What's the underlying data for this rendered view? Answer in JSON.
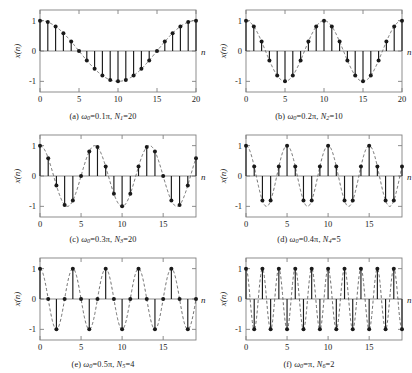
{
  "figure": {
    "ylabel": "x(n)",
    "xlabel": "n",
    "yticks": [
      "1",
      "0",
      "-1"
    ],
    "ylim": [
      -1.35,
      1.35
    ],
    "colors": {
      "stem": "#1a1a1a",
      "marker": "#1a1a1a",
      "envelope": "#555555",
      "axis": "#808080",
      "text": "#1a1a1a"
    }
  },
  "chart_data": [
    {
      "type": "line",
      "panel": "a",
      "title": "(a) ω0=0.1π, N1=20",
      "caption_prefix": "(a) ",
      "omega_label": "ω",
      "omega_sub": "0",
      "omega_value": "=0.1π, ",
      "N_label": "N",
      "N_sub": "1",
      "N_value": "=20",
      "xlabel": "n",
      "ylabel": "x(n)",
      "xlim": [
        0,
        20
      ],
      "ylim": [
        -1.35,
        1.35
      ],
      "xticks": [
        0,
        5,
        10,
        15,
        20
      ],
      "xticklabels": [
        "0",
        "5",
        "10",
        "15",
        "20"
      ],
      "yticks": [
        1,
        0,
        -1
      ],
      "yticklabels": [
        "1",
        "0",
        "-1"
      ],
      "omega": 0.1,
      "period": 20,
      "x": [
        0,
        1,
        2,
        3,
        4,
        5,
        6,
        7,
        8,
        9,
        10,
        11,
        12,
        13,
        14,
        15,
        16,
        17,
        18,
        19,
        20
      ],
      "values": [
        1.0,
        0.951,
        0.809,
        0.588,
        0.309,
        0.0,
        -0.309,
        -0.588,
        -0.809,
        -0.951,
        -1.0,
        -0.951,
        -0.809,
        -0.588,
        -0.309,
        0.0,
        0.309,
        0.588,
        0.809,
        0.951,
        1.0
      ],
      "grid": false,
      "legend": "none"
    },
    {
      "type": "line",
      "panel": "b",
      "title": "(b) ω0=0.2π, N2=10",
      "caption_prefix": "(b) ",
      "omega_label": "ω",
      "omega_sub": "0",
      "omega_value": "=0.2π, ",
      "N_label": "N",
      "N_sub": "2",
      "N_value": "=10",
      "xlabel": "n",
      "ylabel": "x(n)",
      "xlim": [
        0,
        20
      ],
      "ylim": [
        -1.35,
        1.35
      ],
      "xticks": [
        0,
        5,
        10,
        15,
        20
      ],
      "xticklabels": [
        "0",
        "5",
        "10",
        "15",
        "20"
      ],
      "yticks": [
        1,
        0,
        -1
      ],
      "yticklabels": [
        "1",
        "0",
        "-1"
      ],
      "omega": 0.2,
      "period": 10,
      "x": [
        0,
        1,
        2,
        3,
        4,
        5,
        6,
        7,
        8,
        9,
        10,
        11,
        12,
        13,
        14,
        15,
        16,
        17,
        18,
        19,
        20
      ],
      "values": [
        1.0,
        0.809,
        0.309,
        -0.309,
        -0.809,
        -1.0,
        -0.809,
        -0.309,
        0.309,
        0.809,
        1.0,
        0.809,
        0.309,
        -0.309,
        -0.809,
        -1.0,
        -0.809,
        -0.309,
        0.309,
        0.809,
        1.0
      ],
      "grid": false,
      "legend": "none"
    },
    {
      "type": "line",
      "panel": "c",
      "title": "(c) ω0=0.3π, N3=20",
      "caption_prefix": "(c) ",
      "omega_label": "ω",
      "omega_sub": "0",
      "omega_value": "=0.3π, ",
      "N_label": "N",
      "N_sub": "3",
      "N_value": "=20",
      "xlabel": "n",
      "ylabel": "x(n)",
      "xlim": [
        0,
        19
      ],
      "ylim": [
        -1.35,
        1.35
      ],
      "xticks": [
        0,
        5,
        10,
        15
      ],
      "xticklabels": [
        "0",
        "5",
        "10",
        "15"
      ],
      "yticks": [
        1,
        0,
        -1
      ],
      "yticklabels": [
        "1",
        "0",
        "-1"
      ],
      "omega": 0.3,
      "period": 20,
      "x": [
        0,
        1,
        2,
        3,
        4,
        5,
        6,
        7,
        8,
        9,
        10,
        11,
        12,
        13,
        14,
        15,
        16,
        17,
        18,
        19
      ],
      "values": [
        1.0,
        0.588,
        -0.309,
        -0.951,
        -0.809,
        0.0,
        0.809,
        0.951,
        0.309,
        -0.588,
        -1.0,
        -0.588,
        0.309,
        0.951,
        0.809,
        0.0,
        -0.809,
        -0.951,
        -0.309,
        0.588
      ],
      "grid": false,
      "legend": "none"
    },
    {
      "type": "line",
      "panel": "d",
      "title": "(d) ω0=0.4π, N4=5",
      "caption_prefix": "(d) ",
      "omega_label": "ω",
      "omega_sub": "0",
      "omega_value": "=0.4π, ",
      "N_label": "N",
      "N_sub": "4",
      "N_value": "=5",
      "xlabel": "n",
      "ylabel": "x(n)",
      "xlim": [
        0,
        19
      ],
      "ylim": [
        -1.35,
        1.35
      ],
      "xticks": [
        0,
        5,
        10,
        15
      ],
      "xticklabels": [
        "0",
        "5",
        "10",
        "15"
      ],
      "yticks": [
        1,
        0,
        -1
      ],
      "yticklabels": [
        "1",
        "0",
        "-1"
      ],
      "omega": 0.4,
      "period": 5,
      "x": [
        0,
        1,
        2,
        3,
        4,
        5,
        6,
        7,
        8,
        9,
        10,
        11,
        12,
        13,
        14,
        15,
        16,
        17,
        18,
        19
      ],
      "values": [
        1.0,
        0.309,
        -0.809,
        -0.809,
        0.309,
        1.0,
        0.309,
        -0.809,
        -0.809,
        0.309,
        1.0,
        0.309,
        -0.809,
        -0.809,
        0.309,
        1.0,
        0.309,
        -0.809,
        -0.809,
        0.309
      ],
      "grid": false,
      "legend": "none"
    },
    {
      "type": "line",
      "panel": "e",
      "title": "(e) ω0=0.5π, N5=4",
      "caption_prefix": "(e) ",
      "omega_label": "ω",
      "omega_sub": "0",
      "omega_value": "=0.5π, ",
      "N_label": "N",
      "N_sub": "5",
      "N_value": "=4",
      "xlabel": "n",
      "ylabel": "x(n)",
      "xlim": [
        0,
        19
      ],
      "ylim": [
        -1.35,
        1.35
      ],
      "xticks": [
        0,
        5,
        10,
        15
      ],
      "xticklabels": [
        "0",
        "5",
        "10",
        "15"
      ],
      "yticks": [
        1,
        0,
        -1
      ],
      "yticklabels": [
        "1",
        "0",
        "-1"
      ],
      "omega": 0.5,
      "period": 4,
      "x": [
        0,
        1,
        2,
        3,
        4,
        5,
        6,
        7,
        8,
        9,
        10,
        11,
        12,
        13,
        14,
        15,
        16,
        17,
        18,
        19
      ],
      "values": [
        1.0,
        0.0,
        -1.0,
        0.0,
        1.0,
        0.0,
        -1.0,
        0.0,
        1.0,
        0.0,
        -1.0,
        0.0,
        1.0,
        0.0,
        -1.0,
        0.0,
        1.0,
        0.0,
        -1.0,
        0.0
      ],
      "grid": false,
      "legend": "none"
    },
    {
      "type": "line",
      "panel": "f",
      "title": "(f) ω0=π, N6=2",
      "caption_prefix": "(f) ",
      "omega_label": "ω",
      "omega_sub": "0",
      "omega_value": "=π, ",
      "N_label": "N",
      "N_sub": "6",
      "N_value": "=2",
      "xlabel": "n",
      "ylabel": "x(n)",
      "xlim": [
        0,
        19
      ],
      "ylim": [
        -1.35,
        1.35
      ],
      "xticks": [
        0,
        5,
        10,
        15
      ],
      "xticklabels": [
        "0",
        "5",
        "10",
        "15"
      ],
      "yticks": [
        1,
        0,
        -1
      ],
      "yticklabels": [
        "1",
        "0",
        "-1"
      ],
      "omega": 1.0,
      "period": 2,
      "x": [
        0,
        1,
        2,
        3,
        4,
        5,
        6,
        7,
        8,
        9,
        10,
        11,
        12,
        13,
        14,
        15,
        16,
        17,
        18,
        19
      ],
      "values": [
        1.0,
        -1.0,
        1.0,
        -1.0,
        1.0,
        -1.0,
        1.0,
        -1.0,
        1.0,
        -1.0,
        1.0,
        -1.0,
        1.0,
        -1.0,
        1.0,
        -1.0,
        1.0,
        -1.0,
        1.0,
        -1.0
      ],
      "grid": false,
      "legend": "none"
    }
  ]
}
